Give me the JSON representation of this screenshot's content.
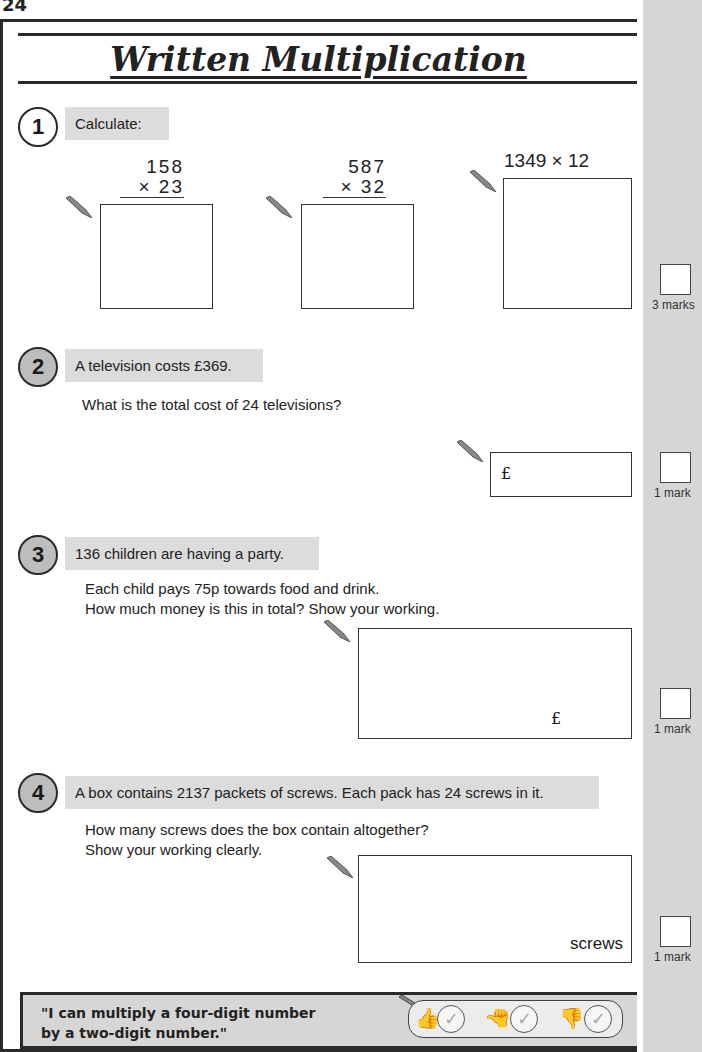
{
  "page": {
    "number": "24",
    "title": "Written Multiplication"
  },
  "questions": [
    {
      "number": "1",
      "heading": "Calculate:",
      "parts": [
        {
          "top": "158",
          "bottom": "× 23"
        },
        {
          "top": "587",
          "bottom": "× 32"
        },
        {
          "inline": "1349 × 12"
        }
      ],
      "marks": "3 marks"
    },
    {
      "number": "2",
      "heading": "A television costs £369.",
      "text": "What is the total cost of 24 televisions?",
      "answer_prefix": "£",
      "marks": "1 mark"
    },
    {
      "number": "3",
      "heading": "136 children are having a party.",
      "text_lines": [
        "Each child pays 75p towards food and drink.",
        "How much money is this in total?  Show your working."
      ],
      "answer_prefix": "£",
      "marks": "1 mark"
    },
    {
      "number": "4",
      "heading": "A box contains 2137 packets of screws.  Each pack has 24 screws in it.",
      "text_lines": [
        "How many screws does the box contain altogether?",
        "Show your working clearly."
      ],
      "answer_unit": "screws",
      "marks": "1 mark"
    }
  ],
  "self_assessment": {
    "line1": "\"I can multiply a four-digit number",
    "line2": "by a two-digit number.\"",
    "options": [
      {
        "icon": "thumbs-up",
        "tick": "✓"
      },
      {
        "icon": "thumbs-sideways",
        "tick": "✓"
      },
      {
        "icon": "thumbs-down",
        "tick": "✓"
      }
    ]
  }
}
